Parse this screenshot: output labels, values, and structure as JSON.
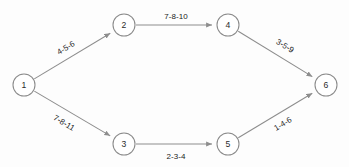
{
  "diagram": {
    "background_color": "#fdfdfd",
    "node_stroke_color": "#8a8a8a",
    "edge_stroke_color": "#8d8d8d",
    "text_color": "#232323",
    "nodes": [
      {
        "id": "1",
        "label": "1",
        "cx": 24,
        "cy": 85,
        "r": 11
      },
      {
        "id": "2",
        "label": "2",
        "cx": 124,
        "cy": 25,
        "r": 11
      },
      {
        "id": "3",
        "label": "3",
        "cx": 124,
        "cy": 144,
        "r": 11
      },
      {
        "id": "4",
        "label": "4",
        "cx": 228,
        "cy": 25,
        "r": 11
      },
      {
        "id": "5",
        "label": "5",
        "cx": 228,
        "cy": 144,
        "r": 11
      },
      {
        "id": "6",
        "label": "6",
        "cx": 326,
        "cy": 85,
        "r": 11
      }
    ],
    "edges": [
      {
        "id": "e12",
        "from": "1",
        "to": "2",
        "label": "4-5-6",
        "label_x": 66,
        "label_y": 48,
        "label_rotation": -31
      },
      {
        "id": "e13",
        "from": "1",
        "to": "3",
        "label": "7-8-11",
        "label_x": 64,
        "label_y": 123,
        "label_rotation": 31
      },
      {
        "id": "e24",
        "from": "2",
        "to": "4",
        "label": "7-8-10",
        "label_x": 176,
        "label_y": 16,
        "label_rotation": 0
      },
      {
        "id": "e35",
        "from": "3",
        "to": "5",
        "label": "2-3-4",
        "label_x": 176,
        "label_y": 156,
        "label_rotation": 0
      },
      {
        "id": "e46",
        "from": "4",
        "to": "6",
        "label": "3-5-9",
        "label_x": 285,
        "label_y": 46,
        "label_rotation": 31
      },
      {
        "id": "e56",
        "from": "5",
        "to": "6",
        "label": "1-4-6",
        "label_x": 283,
        "label_y": 124,
        "label_rotation": -31
      }
    ]
  }
}
